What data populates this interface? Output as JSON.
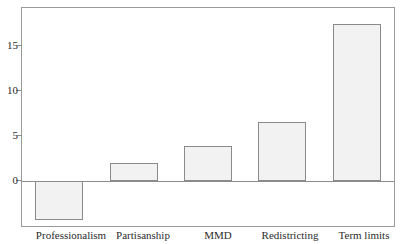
{
  "chart_data": {
    "type": "bar",
    "title": "",
    "subtitle": "",
    "xlabel": "",
    "ylabel": "",
    "categories": [
      "Professionalism",
      "Partisanship",
      "MMD",
      "Redistricting",
      "Term limits"
    ],
    "values": [
      -4.3,
      2.0,
      3.9,
      6.6,
      17.4
    ],
    "ylim": [
      -5.0,
      19.2
    ],
    "yticks": [
      0,
      5,
      10,
      15
    ],
    "ytick_labels": [
      "0",
      "5",
      "10",
      "15"
    ],
    "grid": false,
    "legend": null,
    "legend_position": "none",
    "annotations": [],
    "bar_fill_color": "#f2f2f2",
    "bar_edge_color": "#8a8a8a",
    "axis_color": "#9a9a9a",
    "text_color": "#2b2b2b",
    "background_color": "#ffffff",
    "zero_line_color": "#8c8c8c"
  },
  "axis": {
    "tick_0": "0",
    "tick_5": "5",
    "tick_10": "10",
    "tick_15": "15"
  },
  "labels": {
    "cat_0": "Professionalism",
    "cat_1": "Partisanship",
    "cat_2": "MMD",
    "cat_3": "Redistricting",
    "cat_4": "Term limits"
  }
}
